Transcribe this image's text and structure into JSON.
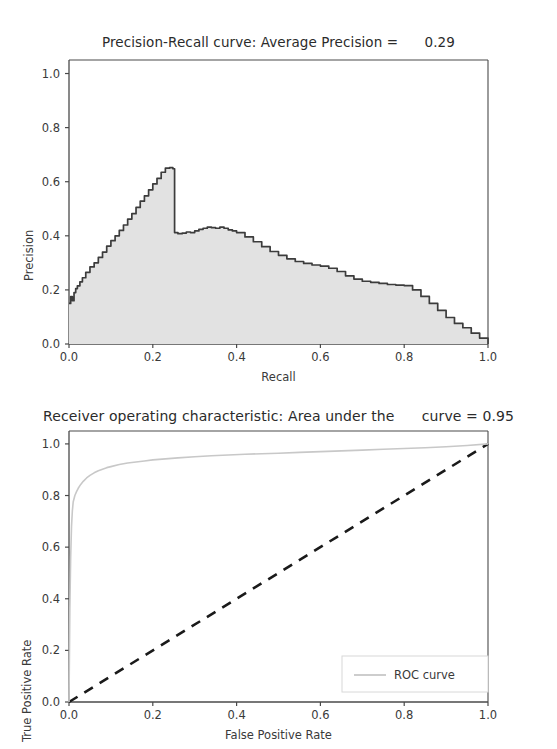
{
  "figures": [
    {
      "id": "precision-recall",
      "title": "Precision-Recall curve: Average Precision =      0.29",
      "xlabel": "Recall",
      "ylabel": "Precision",
      "xticks": [
        "0.0",
        "0.2",
        "0.4",
        "0.6",
        "0.8",
        "1.0"
      ],
      "yticks": [
        "0.0",
        "0.2",
        "0.4",
        "0.6",
        "0.8",
        "1.0"
      ]
    },
    {
      "id": "roc",
      "title": "Receiver operating characteristic: Area under the      curve = 0.95",
      "xlabel": "False Positive Rate",
      "ylabel": "True Positive Rate",
      "xticks": [
        "0.0",
        "0.2",
        "0.4",
        "0.6",
        "0.8",
        "1.0"
      ],
      "yticks": [
        "0.0",
        "0.2",
        "0.4",
        "0.6",
        "0.8",
        "1.0"
      ],
      "legend": [
        {
          "label": "ROC curve",
          "color": "#c8c8c8"
        }
      ]
    }
  ],
  "colors": {
    "pr_line": "#3c3c3c",
    "pr_fill": "#e2e2e2",
    "roc_line": "#c8c8c8",
    "chance_line": "#1a1a1a",
    "axis": "#4a4a4a",
    "text": "#2b2b2b"
  },
  "chart_data": [
    {
      "type": "area",
      "title": "Precision-Recall curve: Average Precision =      0.29",
      "xlabel": "Recall",
      "ylabel": "Precision",
      "xlim": [
        0.0,
        1.0
      ],
      "ylim": [
        0.0,
        1.0
      ],
      "grid": false,
      "average_precision": 0.29,
      "xticks": [
        0.0,
        0.2,
        0.4,
        0.6,
        0.8,
        1.0
      ],
      "yticks": [
        0.0,
        0.2,
        0.4,
        0.6,
        0.8,
        1.0
      ],
      "series": [
        {
          "name": "Precision-Recall curve",
          "x": [
            0.0,
            0.004,
            0.008,
            0.012,
            0.016,
            0.02,
            0.026,
            0.032,
            0.04,
            0.05,
            0.06,
            0.07,
            0.08,
            0.09,
            0.1,
            0.11,
            0.12,
            0.13,
            0.14,
            0.15,
            0.16,
            0.17,
            0.18,
            0.19,
            0.2,
            0.21,
            0.22,
            0.23,
            0.24,
            0.248,
            0.252,
            0.26,
            0.27,
            0.28,
            0.29,
            0.3,
            0.31,
            0.32,
            0.33,
            0.34,
            0.35,
            0.36,
            0.37,
            0.38,
            0.39,
            0.4,
            0.42,
            0.44,
            0.46,
            0.48,
            0.5,
            0.52,
            0.54,
            0.56,
            0.58,
            0.6,
            0.62,
            0.64,
            0.66,
            0.68,
            0.7,
            0.72,
            0.74,
            0.76,
            0.78,
            0.8,
            0.82,
            0.84,
            0.86,
            0.88,
            0.9,
            0.92,
            0.94,
            0.96,
            0.98,
            1.0
          ],
          "y": [
            0.15,
            0.175,
            0.16,
            0.19,
            0.205,
            0.215,
            0.23,
            0.245,
            0.265,
            0.285,
            0.3,
            0.32,
            0.34,
            0.362,
            0.382,
            0.4,
            0.42,
            0.44,
            0.462,
            0.482,
            0.505,
            0.528,
            0.548,
            0.57,
            0.592,
            0.612,
            0.635,
            0.65,
            0.652,
            0.648,
            0.412,
            0.408,
            0.41,
            0.414,
            0.412,
            0.418,
            0.424,
            0.428,
            0.432,
            0.43,
            0.428,
            0.432,
            0.428,
            0.422,
            0.418,
            0.412,
            0.396,
            0.378,
            0.36,
            0.342,
            0.328,
            0.315,
            0.305,
            0.298,
            0.292,
            0.288,
            0.28,
            0.268,
            0.252,
            0.24,
            0.232,
            0.228,
            0.224,
            0.22,
            0.218,
            0.216,
            0.2,
            0.176,
            0.15,
            0.124,
            0.098,
            0.076,
            0.06,
            0.04,
            0.022,
            0.0
          ]
        }
      ]
    },
    {
      "type": "line",
      "title": "Receiver operating characteristic: Area under the      curve = 0.95",
      "xlabel": "False Positive Rate",
      "ylabel": "True Positive Rate",
      "xlim": [
        0.0,
        1.0
      ],
      "ylim": [
        0.0,
        1.05
      ],
      "grid": false,
      "auc": 0.95,
      "xticks": [
        0.0,
        0.2,
        0.4,
        0.6,
        0.8,
        1.0
      ],
      "yticks": [
        0.0,
        0.2,
        0.4,
        0.6,
        0.8,
        1.0
      ],
      "legend_position": "lower right",
      "series": [
        {
          "name": "ROC curve",
          "color": "#c8c8c8",
          "style": "solid",
          "x": [
            0.0,
            0.002,
            0.004,
            0.006,
            0.008,
            0.01,
            0.014,
            0.018,
            0.022,
            0.028,
            0.034,
            0.042,
            0.05,
            0.06,
            0.07,
            0.08,
            0.09,
            0.1,
            0.12,
            0.14,
            0.16,
            0.18,
            0.2,
            0.23,
            0.26,
            0.3,
            0.34,
            0.38,
            0.42,
            0.46,
            0.5,
            0.55,
            0.6,
            0.65,
            0.7,
            0.75,
            0.8,
            0.85,
            0.9,
            0.95,
            1.0
          ],
          "y": [
            0.0,
            0.36,
            0.56,
            0.68,
            0.74,
            0.775,
            0.8,
            0.815,
            0.828,
            0.843,
            0.855,
            0.868,
            0.878,
            0.888,
            0.896,
            0.902,
            0.908,
            0.912,
            0.92,
            0.926,
            0.93,
            0.934,
            0.938,
            0.942,
            0.946,
            0.95,
            0.954,
            0.957,
            0.96,
            0.962,
            0.964,
            0.967,
            0.97,
            0.973,
            0.976,
            0.979,
            0.982,
            0.985,
            0.989,
            0.994,
            1.0
          ]
        },
        {
          "name": "Chance level",
          "color": "#1a1a1a",
          "style": "dashed",
          "x": [
            0.0,
            1.0
          ],
          "y": [
            0.0,
            1.0
          ]
        }
      ]
    }
  ]
}
